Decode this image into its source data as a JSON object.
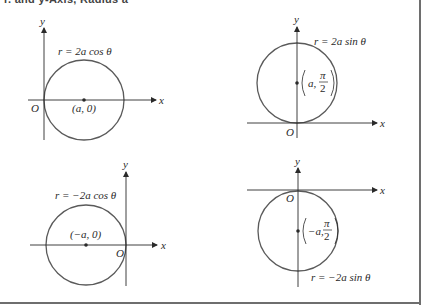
{
  "heading": "r. and y-Axis, Radius a",
  "colors": {
    "circle_stroke": "#5a5a5a",
    "axis_stroke": "#2a2a2a",
    "frame": "#6e6e6e",
    "text": "#2a2a2a"
  },
  "panels": [
    {
      "id": "top-left",
      "equation": "r = 2a cos θ",
      "center_label": "(a, 0)",
      "origin_label": "O",
      "x_label": "x",
      "y_label": "y"
    },
    {
      "id": "top-right",
      "equation": "r = 2a sin θ",
      "center_label_a": "a,",
      "center_label_num": "π",
      "center_label_den": "2",
      "origin_label": "O",
      "x_label": "x",
      "y_label": "y"
    },
    {
      "id": "bottom-left",
      "equation": "r = −2a cos θ",
      "center_label": "(−a, 0)",
      "origin_label": "O",
      "x_label": "x",
      "y_label": "y"
    },
    {
      "id": "bottom-right",
      "equation": "r = −2a sin θ",
      "center_label_a": "−a,",
      "center_label_num": "π",
      "center_label_den": "2",
      "origin_label": "O",
      "x_label": "x",
      "y_label": "y"
    }
  ]
}
